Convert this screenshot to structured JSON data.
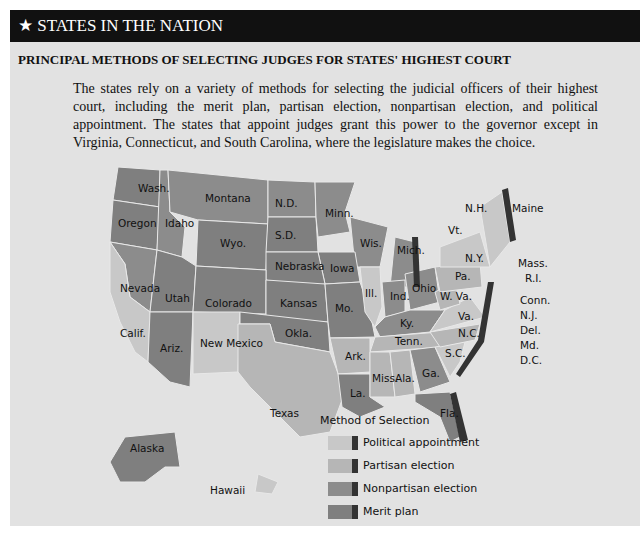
{
  "header": {
    "star": "★",
    "title": "STATES IN THE NATION"
  },
  "subtitle": "PRINCIPAL METHODS OF SELECTING JUDGES FOR STATES' HIGHEST COURT",
  "intro": "The states rely on a variety of methods for selecting the judicial officers of their highest court, including the merit plan, partisan election, nonpartisan election, and political appointment. The states that appoint judges grant this power to the governor except in Virginia, Connecticut, and South Carolina, where the legislature makes the choice.",
  "legend": {
    "title": "Method of Selection",
    "items": [
      {
        "label": "Political appointment",
        "color": "#c8c8c8"
      },
      {
        "label": "Partisan election",
        "color": "#b6b6b6"
      },
      {
        "label": "Nonpartisan election",
        "color": "#8c8c8c"
      },
      {
        "label": "Merit plan",
        "color": "#7f7f7f"
      }
    ]
  },
  "map": {
    "note": "State-to-category assignments are estimated from grayscale shading and are not confirmed; Nonpartisan election vs. Merit plan shades are especially hard to distinguish.",
    "state_labels": [
      "Wash.",
      "Oregon",
      "Idaho",
      "Montana",
      "Wyo.",
      "N.D.",
      "S.D.",
      "Minn.",
      "Wis.",
      "Mich.",
      "Iowa",
      "Nebraska",
      "Nevada",
      "Utah",
      "Colorado",
      "Kansas",
      "Calif.",
      "Ariz.",
      "New Mexico",
      "Okla.",
      "Texas",
      "Mo.",
      "Ill.",
      "Ind.",
      "Ohio",
      "Ky.",
      "Tenn.",
      "Ark.",
      "La.",
      "Miss.",
      "Ala.",
      "Ga.",
      "Fla.",
      "S.C.",
      "N.C.",
      "Va.",
      "W. Va.",
      "Pa.",
      "N.Y.",
      "Vt.",
      "N.H.",
      "Maine",
      "Mass.",
      "R.I.",
      "Conn.",
      "N.J.",
      "Del.",
      "Md.",
      "D.C.",
      "Alaska",
      "Hawaii"
    ]
  }
}
